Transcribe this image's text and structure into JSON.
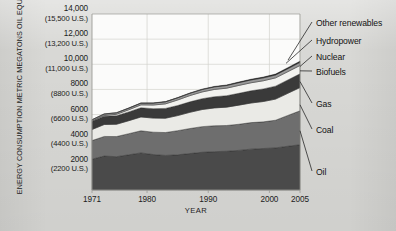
{
  "chart_data": {
    "type": "area",
    "title": "",
    "xlabel": "YEAR",
    "ylabel": "ENERGY CONSUMPTION METRIC MEGATONS OIL EQUIVALENT (U.S. MEGATONS)",
    "x": [
      1971,
      1973,
      1975,
      1977,
      1979,
      1981,
      1983,
      1985,
      1987,
      1989,
      1991,
      1993,
      1995,
      1997,
      1999,
      2001,
      2003,
      2005
    ],
    "xlim": [
      1971,
      2005
    ],
    "ylim": [
      0,
      14000
    ],
    "grid": true,
    "legend_position": "right-outside-leader-lines",
    "y_ticks": [
      {
        "value": 2000,
        "label": "2000",
        "sub": "(2200 U.S.)"
      },
      {
        "value": 4000,
        "label": "4000",
        "sub": "(4400 U.S.)"
      },
      {
        "value": 6000,
        "label": "6000",
        "sub": "(6600 U.S.)"
      },
      {
        "value": 8000,
        "label": "8000",
        "sub": "(8800 U.S.)"
      },
      {
        "value": 10000,
        "label": "10,000",
        "sub": "(11,000 U.S.)"
      },
      {
        "value": 12000,
        "label": "12,000",
        "sub": "(13,200 U.S.)"
      },
      {
        "value": 14000,
        "label": "14,000",
        "sub": "(15,500 U.S.)"
      }
    ],
    "x_ticks": [
      {
        "value": 1971,
        "label": "1971"
      },
      {
        "value": 1980,
        "label": "1980"
      },
      {
        "value": 1990,
        "label": "1990"
      },
      {
        "value": 2000,
        "label": "2000"
      },
      {
        "value": 2005,
        "label": "2005"
      }
    ],
    "stack_order_bottom_to_top": [
      "Oil",
      "Coal",
      "Gas",
      "Biofuels",
      "Nuclear",
      "Hydropower",
      "Other renewables"
    ],
    "series": [
      {
        "name": "Oil",
        "color": "#4a4a4a",
        "values": [
          2450,
          2700,
          2650,
          2800,
          2950,
          2820,
          2750,
          2800,
          2900,
          3000,
          3050,
          3080,
          3150,
          3250,
          3300,
          3350,
          3480,
          3600
        ]
      },
      {
        "name": "Coal",
        "color": "#6e6e6e",
        "values": [
          1480,
          1560,
          1600,
          1680,
          1760,
          1780,
          1820,
          1920,
          1990,
          2040,
          2060,
          2050,
          2080,
          2110,
          2120,
          2200,
          2450,
          2700
        ]
      },
      {
        "name": "Gas",
        "color": "#eaeae6",
        "values": [
          880,
          950,
          980,
          1030,
          1100,
          1120,
          1140,
          1200,
          1290,
          1360,
          1420,
          1460,
          1520,
          1560,
          1620,
          1680,
          1760,
          1850
        ]
      },
      {
        "name": "Biofuels",
        "color": "#3a3a3a",
        "values": [
          640,
          660,
          680,
          700,
          730,
          750,
          780,
          800,
          830,
          860,
          890,
          910,
          940,
          970,
          1000,
          1030,
          1060,
          1090
        ]
      },
      {
        "name": "Nuclear",
        "color": "#f2f2ef",
        "values": [
          30,
          60,
          110,
          170,
          230,
          290,
          360,
          440,
          500,
          540,
          580,
          600,
          630,
          640,
          650,
          660,
          660,
          665
        ]
      },
      {
        "name": "Hydropower",
        "color": "#9a9a9a",
        "values": [
          105,
          115,
          120,
          130,
          140,
          150,
          160,
          170,
          180,
          190,
          200,
          210,
          220,
          225,
          230,
          230,
          240,
          250
        ]
      },
      {
        "name": "Other renewables",
        "color": "#1a1a1a",
        "values": [
          8,
          9,
          10,
          12,
          14,
          17,
          20,
          24,
          28,
          33,
          38,
          44,
          50,
          56,
          62,
          70,
          80,
          95
        ]
      }
    ]
  },
  "series_labels": [
    {
      "name": "Other renewables"
    },
    {
      "name": "Hydropower"
    },
    {
      "name": "Nuclear"
    },
    {
      "name": "Biofuels"
    },
    {
      "name": "Gas"
    },
    {
      "name": "Coal"
    },
    {
      "name": "Oil"
    }
  ],
  "colors": {
    "figure_background": "#d8d8d5",
    "plot_background": "#fbfbfa",
    "grid": "#d2d2cd",
    "axis": "#9b9b96",
    "text": "#1c1c1c"
  }
}
